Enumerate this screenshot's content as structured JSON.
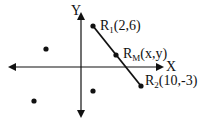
{
  "axes": {
    "x_label": "X",
    "y_label": "Y"
  },
  "points": {
    "r1": {
      "name": "R",
      "sub": "1",
      "coords": "(2,6)"
    },
    "rm": {
      "name": "R",
      "sub": "M",
      "coords": "(x,y)"
    },
    "r2": {
      "name": "R",
      "sub": "2",
      "coords": "(10,-3)"
    }
  },
  "colors": {
    "stroke": "#111111",
    "background": "#ffffff"
  }
}
